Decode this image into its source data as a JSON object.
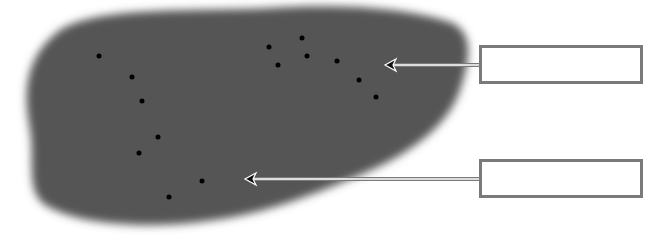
{
  "diagram": {
    "title": "",
    "background_color": "#ffffff",
    "region": {
      "name": "dark-blob",
      "fill_color": "#555555"
    },
    "dots": {
      "color": "#000000",
      "points": [
        {
          "x": 99,
          "y": 56
        },
        {
          "x": 132,
          "y": 77
        },
        {
          "x": 142,
          "y": 101
        },
        {
          "x": 158,
          "y": 137
        },
        {
          "x": 139,
          "y": 153
        },
        {
          "x": 202,
          "y": 181
        },
        {
          "x": 169,
          "y": 197
        },
        {
          "x": 269,
          "y": 47
        },
        {
          "x": 302,
          "y": 38
        },
        {
          "x": 307,
          "y": 56
        },
        {
          "x": 278,
          "y": 65
        },
        {
          "x": 337,
          "y": 61
        },
        {
          "x": 359,
          "y": 80
        },
        {
          "x": 376,
          "y": 97
        }
      ]
    },
    "labels": [
      {
        "id": "label-1",
        "text": "",
        "box": {
          "x": 479,
          "y": 45,
          "w": 164,
          "h": 39
        },
        "arrow_tip": {
          "x": 385,
          "y": 65
        }
      },
      {
        "id": "label-2",
        "text": "",
        "box": {
          "x": 479,
          "y": 159,
          "w": 164,
          "h": 39
        },
        "arrow_tip": {
          "x": 245,
          "y": 179
        }
      }
    ],
    "label_border_color": "#7a7a7a",
    "arrow_color": "#7a7a7a"
  }
}
